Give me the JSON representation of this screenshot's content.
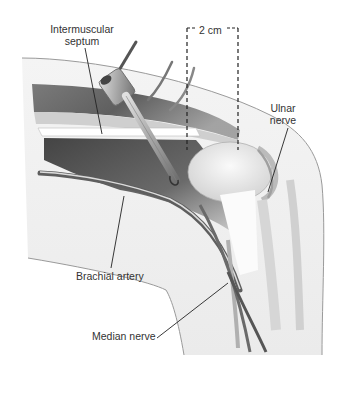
{
  "figure": {
    "type": "surgical anatomical illustration",
    "colors": {
      "background": "#ffffff",
      "skin_outline": "#9a9a9a",
      "skin_fill": "#f1f1f1",
      "muscle_dark": "#5a5a5a",
      "muscle_mid": "#8c8c8c",
      "bone": "#e6e6e6",
      "instrument": "#b8b8b8",
      "leader_line": "#222222",
      "text": "#333333"
    }
  },
  "labels": {
    "intermuscular_septum": "Intermuscular\nseptum",
    "intermuscular_septum_line1": "Intermuscular",
    "intermuscular_septum_line2": "septum",
    "scale": "2 cm",
    "ulnar_nerve_line1": "Ulnar",
    "ulnar_nerve_line2": "nerve",
    "brachial_artery": "Brachial artery",
    "median_nerve": "Median nerve"
  },
  "annotations": {
    "scale_bar": {
      "value": 2,
      "unit": "cm",
      "style": "dashed bracket"
    }
  }
}
